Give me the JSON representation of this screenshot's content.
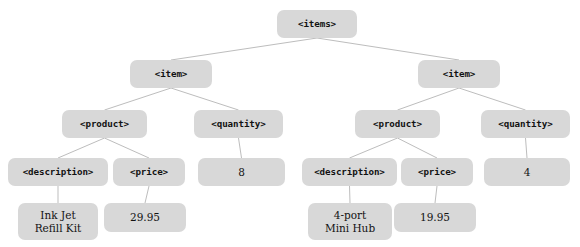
{
  "diagram": {
    "type": "tree",
    "node_fill": "#d8d8d8",
    "edge_color": "#bdbdbd",
    "background": "#ffffff",
    "nodes": [
      {
        "id": "items",
        "label": "<items>",
        "kind": "tag",
        "x": 277,
        "y": 10,
        "w": 80,
        "h": 28
      },
      {
        "id": "item1",
        "label": "<item>",
        "kind": "tag",
        "x": 130,
        "y": 60,
        "w": 82,
        "h": 28
      },
      {
        "id": "item2",
        "label": "<item>",
        "kind": "tag",
        "x": 418,
        "y": 60,
        "w": 82,
        "h": 28
      },
      {
        "id": "product1",
        "label": "<product>",
        "kind": "tag",
        "x": 62,
        "y": 110,
        "w": 85,
        "h": 28
      },
      {
        "id": "quantity1",
        "label": "<quantity>",
        "kind": "tag",
        "x": 194,
        "y": 110,
        "w": 89,
        "h": 28
      },
      {
        "id": "product2",
        "label": "<product>",
        "kind": "tag",
        "x": 355,
        "y": 110,
        "w": 85,
        "h": 28
      },
      {
        "id": "quantity2",
        "label": "<quantity>",
        "kind": "tag",
        "x": 481,
        "y": 110,
        "w": 89,
        "h": 28
      },
      {
        "id": "description1",
        "label": "<description>",
        "kind": "tag",
        "x": 8,
        "y": 158,
        "w": 100,
        "h": 28
      },
      {
        "id": "price1",
        "label": "<price>",
        "kind": "tag",
        "x": 113,
        "y": 158,
        "w": 72,
        "h": 28
      },
      {
        "id": "qtyval1",
        "label": "8",
        "kind": "value",
        "x": 198,
        "y": 158,
        "w": 87,
        "h": 28
      },
      {
        "id": "description2",
        "label": "<description>",
        "kind": "tag",
        "x": 302,
        "y": 158,
        "w": 95,
        "h": 28
      },
      {
        "id": "price2",
        "label": "<price>",
        "kind": "tag",
        "x": 401,
        "y": 158,
        "w": 72,
        "h": 28
      },
      {
        "id": "qtyval2",
        "label": "4",
        "kind": "value",
        "x": 484,
        "y": 158,
        "w": 86,
        "h": 28
      },
      {
        "id": "descval1",
        "label": "Ink Jet\nRefill Kit",
        "kind": "value",
        "x": 18,
        "y": 203,
        "w": 80,
        "h": 37
      },
      {
        "id": "priceval1",
        "label": "29.95",
        "kind": "value",
        "x": 104,
        "y": 203,
        "w": 82,
        "h": 29
      },
      {
        "id": "descval2",
        "label": "4-port\nMini Hub",
        "kind": "value",
        "x": 308,
        "y": 203,
        "w": 84,
        "h": 37
      },
      {
        "id": "priceval2",
        "label": "19.95",
        "kind": "value",
        "x": 394,
        "y": 203,
        "w": 82,
        "h": 29
      }
    ],
    "edges": [
      {
        "from": "items",
        "to": "item1"
      },
      {
        "from": "items",
        "to": "item2"
      },
      {
        "from": "item1",
        "to": "product1"
      },
      {
        "from": "item1",
        "to": "quantity1"
      },
      {
        "from": "item2",
        "to": "product2"
      },
      {
        "from": "item2",
        "to": "quantity2"
      },
      {
        "from": "product1",
        "to": "description1"
      },
      {
        "from": "product1",
        "to": "price1"
      },
      {
        "from": "quantity1",
        "to": "qtyval1"
      },
      {
        "from": "product2",
        "to": "description2"
      },
      {
        "from": "product2",
        "to": "price2"
      },
      {
        "from": "quantity2",
        "to": "qtyval2"
      },
      {
        "from": "description1",
        "to": "descval1"
      },
      {
        "from": "price1",
        "to": "priceval1"
      },
      {
        "from": "description2",
        "to": "descval2"
      },
      {
        "from": "price2",
        "to": "priceval2"
      }
    ]
  }
}
